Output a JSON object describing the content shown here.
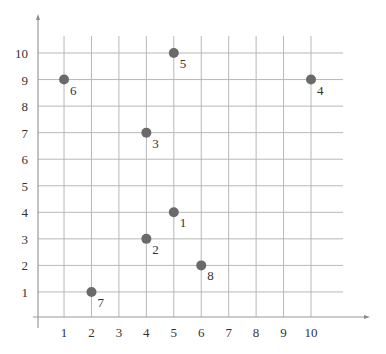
{
  "chart_data": {
    "type": "scatter",
    "title": "",
    "xlabel": "",
    "ylabel": "",
    "xlim": [
      0,
      11
    ],
    "ylim": [
      0,
      10.5
    ],
    "grid": true,
    "legend": null,
    "x_ticks": [
      1,
      2,
      3,
      4,
      5,
      6,
      7,
      8,
      9,
      10
    ],
    "y_ticks": [
      1,
      2,
      3,
      4,
      5,
      6,
      7,
      8,
      9,
      10
    ],
    "points": [
      {
        "label": "1",
        "x": 5,
        "y": 4
      },
      {
        "label": "2",
        "x": 4,
        "y": 3
      },
      {
        "label": "3",
        "x": 4,
        "y": 7
      },
      {
        "label": "4",
        "x": 10,
        "y": 9
      },
      {
        "label": "5",
        "x": 5,
        "y": 10
      },
      {
        "label": "6",
        "x": 1,
        "y": 9
      },
      {
        "label": "7",
        "x": 2,
        "y": 1
      },
      {
        "label": "8",
        "x": 6,
        "y": 2
      }
    ],
    "colors": {
      "dot": "#6a6a6a",
      "grid": "#b8b8b8",
      "axis": "#9a9a9a",
      "text": "#333333"
    }
  }
}
